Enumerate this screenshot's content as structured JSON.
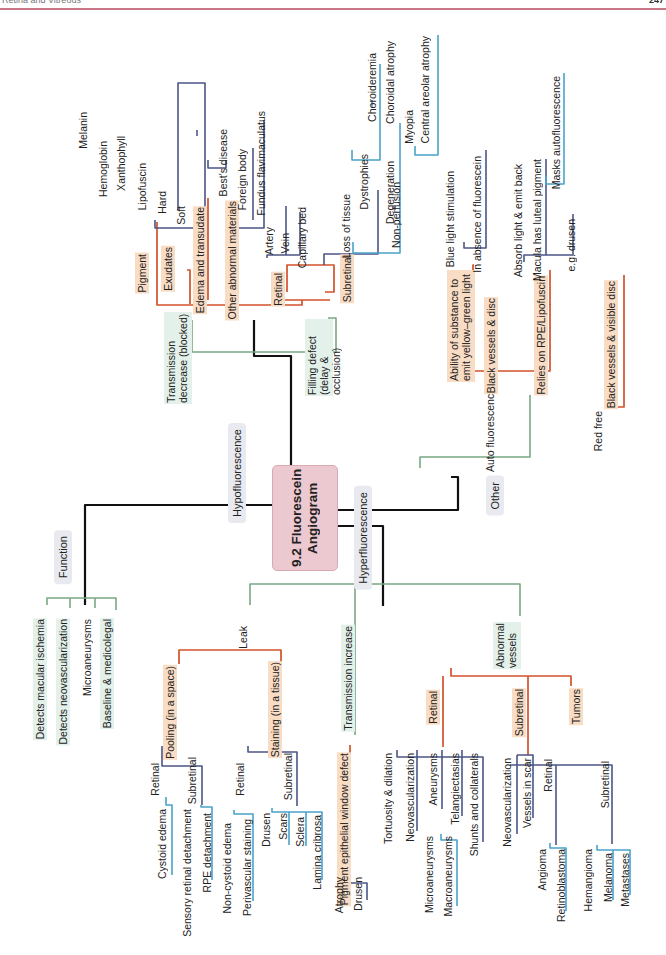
{
  "header": {
    "left_text": "Retina and Vitreous",
    "page_number": "247",
    "rule_color": "#c9788a"
  },
  "colors": {
    "root": "#111111",
    "level1": "#7aa882",
    "level2": "#d2522b",
    "level3": "#4d5586",
    "level4": "#4aa3c9",
    "center_fill": "#ecc8d0"
  },
  "center": {
    "title": "9.2 Fluorescein Angiogram"
  },
  "branches": {
    "hypo": {
      "label": "Hypofluorescence"
    },
    "hyper": {
      "label": "Hyperfluorescence"
    },
    "function": {
      "label": "Function"
    },
    "other": {
      "label": "Other"
    }
  },
  "hypo": {
    "transmission_decrease": "Transmission decrease (blocked)",
    "filling_defect": "Filling defect (delay & occlusion)",
    "pigment": "Pigment",
    "pigment_items": [
      "Melanin",
      "Hemoglobin",
      "Xanthophyll",
      "Lipofuscin"
    ],
    "exudates": "Exudates",
    "exudate_items": [
      "Hard",
      "Soft"
    ],
    "edema": "Edema and transudate",
    "other_abnormal": "Other abnormal materials",
    "other_abnormal_items": [
      "Best's disease",
      "Foreign body",
      "Fundus flavimaculatus"
    ],
    "retinal": "Retinal",
    "retinal_items": [
      "Artery",
      "Vein",
      "Capillary bed"
    ],
    "subretinal": "Subretinal",
    "loss_of_tissue": "Loss of tissue",
    "non_perfusion": "Non-perfusion",
    "dystrophies": "Dystrophies",
    "dystrophy_items": [
      "Choroideremia",
      "Choroidal atrophy"
    ],
    "degeneration": "Degeneration",
    "degeneration_items": [
      "Myopia",
      "Central areolar atrophy"
    ]
  },
  "other": {
    "auto_fluorescence": "Auto fluorescence",
    "red_free": "Red free",
    "ability": "Ability of substance to emit yellow–green light",
    "black_vessels_disc": "Black vessels & disc",
    "relies_on": "Relies on RPE/Lipofuscin",
    "blue_light": "Blue light stimulation",
    "absence": "In absence of fluorescein",
    "absorb": "Absorb light & emit back",
    "macula": "Macula has luteal pigment",
    "masks": "Masks autofluorescence",
    "eg_drusen": "e.g. drusen",
    "black_vessels_visible": "Black vessels & visible disc"
  },
  "function": {
    "items": [
      "Detects macular ischemia",
      "Detects neovascularization",
      "Microaneurysms",
      "Baseline & medicolegal"
    ]
  },
  "hyper": {
    "leak": "Leak",
    "pooling": "Pooling (in a space)",
    "staining": "Staining (in a tissue)",
    "pooling_retinal": "Retinal",
    "pooling_retinal_items": [
      "Cystoid edema",
      "Sensory retinal detachment"
    ],
    "pooling_subretinal": "Subretinal",
    "pooling_subretinal_items": [
      "RPE detachment"
    ],
    "staining_retinal": "Retinal",
    "staining_retinal_items": [
      "Non-cystoid edema",
      "Perivascular staining"
    ],
    "staining_subretinal": "Subretinal",
    "staining_subretinal_items": [
      "Drusen",
      "Scars",
      "Sclera",
      "Lamina cribrosa"
    ],
    "transmission_increase": "Transmission increase",
    "pigment_window": "Pigment epithelial window defect",
    "window_items": [
      "Atrophy",
      "Drusen"
    ],
    "abnormal_vessels": "Abnormal vessels",
    "av_retinal": "Retinal",
    "av_retinal_items": [
      "Tortuosity & dilation",
      "Neovascularization",
      "Aneurysms",
      "Telangiectasias",
      "Shunts and collaterals"
    ],
    "aneurysm_items": [
      "Microaneurysms",
      "Macroaneurysms"
    ],
    "av_subretinal": "Subretinal",
    "av_subretinal_items": [
      "Neovascularization",
      "Vessels in scar"
    ],
    "tumors": "Tumors",
    "tumor_retinal": "Retinal",
    "tumor_retinal_items": [
      "Angioma",
      "Retinoblastoma"
    ],
    "tumor_subretinal": "Subretinal",
    "tumor_subretinal_items": [
      "Hemangioma",
      "Melanoma",
      "Metastases"
    ]
  }
}
